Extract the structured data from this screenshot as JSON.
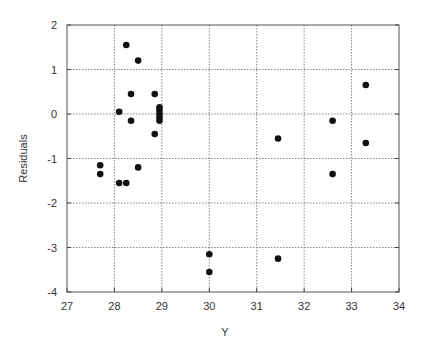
{
  "chart_data": {
    "type": "scatter",
    "title": "",
    "xlabel": "Y",
    "ylabel": "Residuals",
    "xlim": [
      27,
      34
    ],
    "ylim": [
      -4,
      2
    ],
    "xticks": [
      27,
      28,
      29,
      30,
      31,
      32,
      33,
      34
    ],
    "yticks": [
      -4,
      -3,
      -2,
      -1,
      0,
      1,
      2
    ],
    "grid": true,
    "legend": null,
    "marker_color": "#111111",
    "points": [
      {
        "x": 27.7,
        "y": -1.15
      },
      {
        "x": 27.7,
        "y": -1.35
      },
      {
        "x": 28.1,
        "y": 0.05
      },
      {
        "x": 28.1,
        "y": -1.55
      },
      {
        "x": 28.25,
        "y": 1.55
      },
      {
        "x": 28.25,
        "y": -1.55
      },
      {
        "x": 28.35,
        "y": 0.45
      },
      {
        "x": 28.35,
        "y": -0.15
      },
      {
        "x": 28.5,
        "y": 1.2
      },
      {
        "x": 28.5,
        "y": -1.2
      },
      {
        "x": 28.85,
        "y": 0.45
      },
      {
        "x": 28.85,
        "y": -0.45
      },
      {
        "x": 28.95,
        "y": 0.15
      },
      {
        "x": 28.95,
        "y": 0.08
      },
      {
        "x": 28.95,
        "y": 0.0
      },
      {
        "x": 28.95,
        "y": -0.08
      },
      {
        "x": 28.95,
        "y": -0.15
      },
      {
        "x": 30.0,
        "y": -3.15
      },
      {
        "x": 30.0,
        "y": -3.55
      },
      {
        "x": 31.45,
        "y": -0.55
      },
      {
        "x": 31.45,
        "y": -3.25
      },
      {
        "x": 32.6,
        "y": -0.15
      },
      {
        "x": 32.6,
        "y": -1.35
      },
      {
        "x": 33.3,
        "y": 0.65
      },
      {
        "x": 33.3,
        "y": -0.65
      }
    ]
  }
}
